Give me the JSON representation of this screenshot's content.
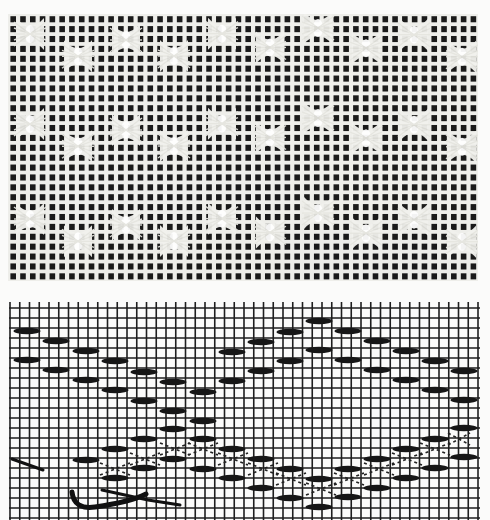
{
  "photo": {
    "description": "Photograph of white open-weave fabric with hourglass / leno lace groupings forming diagonal diamond bands",
    "background_color": "#1a1a1a",
    "thread_color": "#eeeeea",
    "columns": 48,
    "rows": 27
  },
  "diagram": {
    "grid_color": "#1e1e1e",
    "paper_color": "#fbfbfa",
    "grid": {
      "x_start": 10,
      "x_end": 479,
      "x_step": 9.75,
      "y_start": 308,
      "y_end": 520,
      "y_step": 10
    },
    "floats_upper": [
      [
        27,
        331
      ],
      [
        56,
        341
      ],
      [
        86,
        351
      ],
      [
        115,
        361
      ],
      [
        144,
        372
      ],
      [
        173,
        382
      ],
      [
        203,
        392
      ],
      [
        27,
        360
      ],
      [
        56,
        370
      ],
      [
        86,
        380
      ],
      [
        115,
        390
      ],
      [
        144,
        401
      ],
      [
        173,
        411
      ],
      [
        203,
        421
      ],
      [
        232,
        352
      ],
      [
        261,
        342
      ],
      [
        290,
        332
      ],
      [
        319,
        321
      ],
      [
        348,
        331
      ],
      [
        377,
        341
      ],
      [
        406,
        351
      ],
      [
        435,
        361
      ],
      [
        464,
        371
      ],
      [
        232,
        381
      ],
      [
        261,
        371
      ],
      [
        290,
        361
      ],
      [
        319,
        350
      ],
      [
        348,
        360
      ],
      [
        377,
        370
      ],
      [
        406,
        380
      ],
      [
        435,
        390
      ],
      [
        464,
        400
      ]
    ],
    "floats_lower": [
      [
        86,
        460
      ],
      [
        115,
        449
      ],
      [
        144,
        439
      ],
      [
        173,
        429
      ],
      [
        203,
        439
      ],
      [
        232,
        449
      ],
      [
        261,
        459
      ],
      [
        290,
        469
      ],
      [
        319,
        479
      ],
      [
        348,
        469
      ],
      [
        377,
        459
      ],
      [
        406,
        449
      ],
      [
        435,
        439
      ],
      [
        464,
        428
      ],
      [
        115,
        478
      ],
      [
        144,
        468
      ],
      [
        173,
        459
      ],
      [
        203,
        469
      ],
      [
        232,
        478
      ],
      [
        261,
        488
      ],
      [
        290,
        498
      ],
      [
        319,
        507
      ],
      [
        348,
        497
      ],
      [
        377,
        488
      ],
      [
        406,
        478
      ],
      [
        435,
        468
      ],
      [
        464,
        457
      ]
    ],
    "crossings": [
      [
        100,
        463,
        130,
        475
      ],
      [
        130,
        453,
        160,
        465
      ],
      [
        160,
        443,
        190,
        455
      ],
      [
        188,
        443,
        218,
        455
      ],
      [
        218,
        453,
        248,
        465
      ],
      [
        248,
        463,
        278,
        475
      ],
      [
        276,
        473,
        306,
        485
      ],
      [
        306,
        483,
        336,
        495
      ],
      [
        334,
        473,
        364,
        485
      ],
      [
        364,
        463,
        394,
        475
      ],
      [
        392,
        453,
        422,
        465
      ],
      [
        420,
        443,
        450,
        455
      ],
      [
        448,
        433,
        470,
        445
      ]
    ],
    "needle_marks": [
      [
        12,
        458,
        42,
        470
      ],
      [
        75,
        490,
        180,
        505
      ]
    ]
  }
}
